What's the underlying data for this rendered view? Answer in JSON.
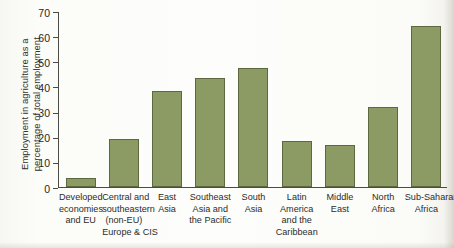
{
  "chart_data": {
    "type": "bar",
    "title": "",
    "xlabel": "",
    "ylabel": "Employment in agriculture as a percentage of total employment",
    "ylim": [
      0,
      70
    ],
    "yticks": [
      0,
      10,
      20,
      30,
      40,
      50,
      60,
      70
    ],
    "grid": false,
    "legend": null,
    "categories": [
      "Developed economies and EU",
      "Central and southeastern (non-EU) Europe & CIS",
      "East Asia",
      "Southeast Asia and the Pacific",
      "South Asia",
      "Latin America and the Caribbean",
      "Middle East",
      "North Africa",
      "Sub-Saharan Africa"
    ],
    "values": [
      3.5,
      19.2,
      38.2,
      43.5,
      47.5,
      18.5,
      16.8,
      31.8,
      64.0
    ],
    "bar_color": "#8c9b63",
    "bar_edge_color": "#5d6840",
    "axis_color": "#4a4a46"
  },
  "y_axis": {
    "title_lines": [
      "Employment in agriculture as a",
      "percentage of total employment"
    ],
    "tick_labels": [
      "70",
      "60",
      "50",
      "40",
      "30",
      "20",
      "10",
      "0"
    ]
  },
  "x_axis": {
    "categories": [
      {
        "lines": [
          "Developed",
          "economies",
          "and EU"
        ]
      },
      {
        "lines": [
          "Central and",
          "southeastern",
          "(non-EU)",
          "Europe & CIS"
        ]
      },
      {
        "lines": [
          "East",
          "Asia"
        ]
      },
      {
        "lines": [
          "Southeast",
          "Asia and",
          "the Pacific"
        ]
      },
      {
        "lines": [
          "South",
          "Asia"
        ]
      },
      {
        "lines": [
          "Latin",
          "America",
          "and the",
          "Caribbean"
        ]
      },
      {
        "lines": [
          "Middle",
          "East"
        ]
      },
      {
        "lines": [
          "North",
          "Africa"
        ]
      },
      {
        "lines": [
          "Sub-Saharan",
          "Africa"
        ]
      }
    ]
  }
}
